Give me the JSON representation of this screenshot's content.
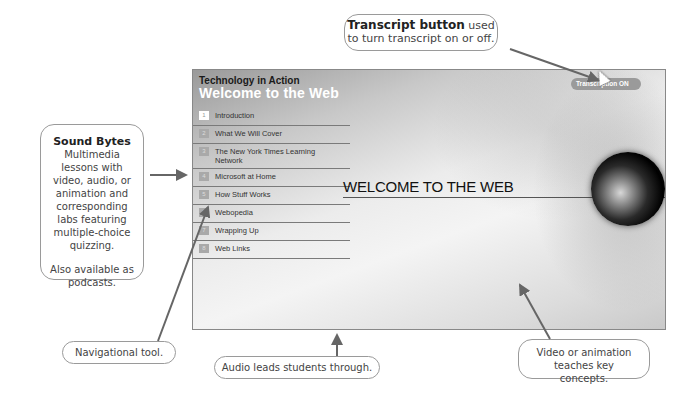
{
  "app": {
    "series_title": "Technology in Action",
    "lesson_title": "Welcome to the Web",
    "main_heading": "WELCOME TO THE WEB",
    "transcript_button_label": "Transcription ON"
  },
  "menu": {
    "items": [
      {
        "num": "1",
        "label": "Introduction",
        "active": true
      },
      {
        "num": "2",
        "label": "What We Will Cover"
      },
      {
        "num": "3",
        "label": "The New York Times Learning Network"
      },
      {
        "num": "4",
        "label": "Microsoft at Home"
      },
      {
        "num": "5",
        "label": "How Stuff Works"
      },
      {
        "num": "6",
        "label": "Webopedia"
      },
      {
        "num": "7",
        "label": "Wrapping Up"
      },
      {
        "num": "8",
        "label": "Web Links"
      }
    ]
  },
  "callouts": {
    "transcript": {
      "bold": "Transcript button",
      "text": " used to turn transcript on or off."
    },
    "sound_bytes": {
      "title": "Sound Bytes",
      "body": "Multimedia lessons with video, audio, or animation and corresponding labs featuring multiple-choice quizzing.",
      "extra": "Also available as podcasts."
    },
    "navigational": "Navigational tool.",
    "audio": "Audio leads students through.",
    "video": "Video or animation teaches key concepts."
  }
}
